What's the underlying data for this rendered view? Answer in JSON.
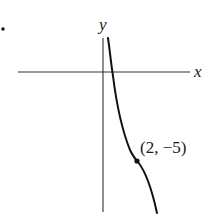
{
  "figure": {
    "bullet": "•",
    "axes": {
      "x_label": "x",
      "y_label": "y"
    },
    "point": {
      "label": "(2, −5)",
      "x": 2,
      "y": -5
    },
    "colors": {
      "ink": "#1a1a1a",
      "background": "#ffffff"
    }
  }
}
